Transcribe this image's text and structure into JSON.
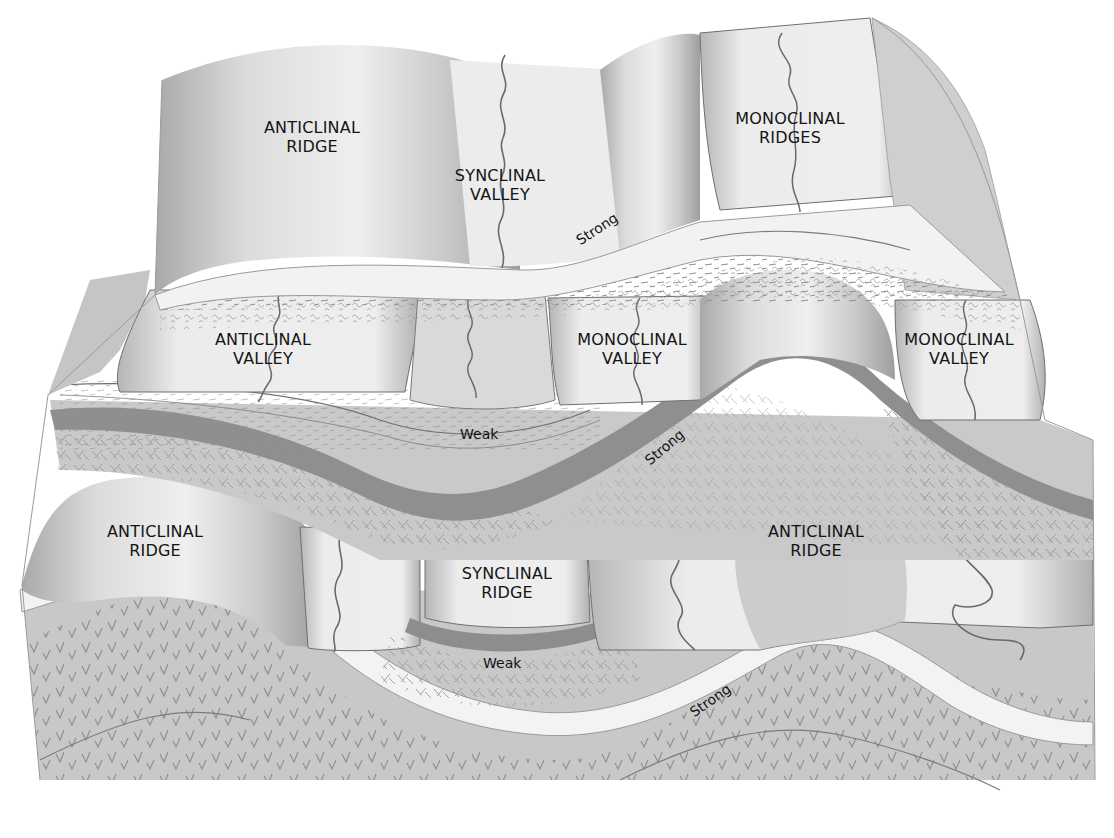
{
  "figure": {
    "type": "block-diagram",
    "style": "grayscale illustration",
    "colors": {
      "background": "#ffffff",
      "surface_light": "#ebebeb",
      "surface_shaded": "#bdbdbd",
      "strong_layer_light": "#f1f1f1",
      "strong_layer_dark": "#8c8c8c",
      "weak_layer": "#c4c4c4",
      "text": "#141414"
    },
    "tiers": [
      "upper",
      "middle",
      "lower"
    ]
  },
  "landform_labels": [
    {
      "id": "upper-anticlinal-ridge",
      "line1": "ANTICLINAL",
      "line2": "RIDGE",
      "x": 312,
      "y": 118
    },
    {
      "id": "upper-synclinal-valley",
      "line1": "SYNCLINAL",
      "line2": "VALLEY",
      "x": 500,
      "y": 166
    },
    {
      "id": "upper-monoclinal-ridges",
      "line1": "MONOCLINAL",
      "line2": "RIDGES",
      "x": 790,
      "y": 109
    },
    {
      "id": "middle-anticlinal-valley",
      "line1": "ANTICLINAL",
      "line2": "VALLEY",
      "x": 263,
      "y": 330
    },
    {
      "id": "middle-monoclinal-valley-1",
      "line1": "MONOCLINAL",
      "line2": "VALLEY",
      "x": 632,
      "y": 330
    },
    {
      "id": "middle-monoclinal-valley-2",
      "line1": "MONOCLINAL",
      "line2": "VALLEY",
      "x": 959,
      "y": 330
    },
    {
      "id": "lower-anticlinal-ridge-left",
      "line1": "ANTICLINAL",
      "line2": "RIDGE",
      "x": 155,
      "y": 522
    },
    {
      "id": "lower-synclinal-ridge",
      "line1": "SYNCLINAL",
      "line2": "RIDGE",
      "x": 507,
      "y": 564
    },
    {
      "id": "lower-anticlinal-ridge-right",
      "line1": "ANTICLINAL",
      "line2": "RIDGE",
      "x": 816,
      "y": 522
    }
  ],
  "rock_labels": [
    {
      "id": "strong-upper",
      "text": "Strong",
      "x": 598,
      "y": 235,
      "angle": -33
    },
    {
      "id": "weak-middle",
      "text": "Weak",
      "x": 481,
      "y": 425,
      "angle": 0
    },
    {
      "id": "strong-middle",
      "text": "Strong",
      "x": 662,
      "y": 448,
      "angle": -40
    },
    {
      "id": "weak-lower",
      "text": "Weak",
      "x": 483,
      "y": 658,
      "angle": 0
    },
    {
      "id": "strong-lower",
      "text": "Strong",
      "x": 700,
      "y": 697,
      "angle": -35
    }
  ],
  "caption": {
    "visible": "cut off at bottom edge (illegible)"
  }
}
